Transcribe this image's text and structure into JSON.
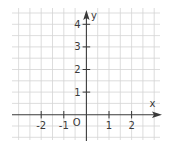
{
  "diagram": {
    "type": "coordinate-grid",
    "axes": {
      "x_label": "x",
      "y_label": "y",
      "origin_label": "O"
    },
    "x_ticks": [
      {
        "value": -2,
        "label": "-2"
      },
      {
        "value": -1,
        "label": "-1"
      },
      {
        "value": 1,
        "label": "1"
      },
      {
        "value": 2,
        "label": "2"
      }
    ],
    "y_ticks": [
      {
        "value": 1,
        "label": "1"
      },
      {
        "value": 2,
        "label": "2"
      },
      {
        "value": 3,
        "label": "3"
      },
      {
        "value": 4,
        "label": "4"
      }
    ],
    "grid": {
      "step": 0.5,
      "x_range": [
        -3,
        3
      ],
      "y_range": [
        -1,
        4.5
      ]
    },
    "colors": {
      "grid": "#d4d4d4",
      "axis": "#3a3a3a",
      "background": "#ffffff"
    }
  }
}
